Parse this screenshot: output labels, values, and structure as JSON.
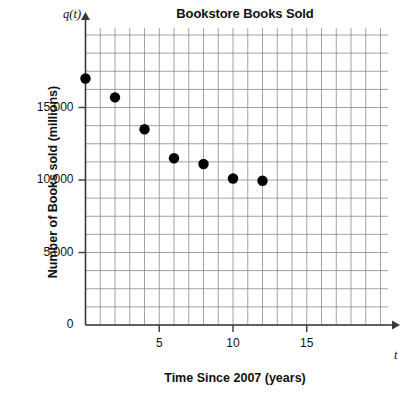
{
  "chart_data": {
    "type": "scatter",
    "title": "Bookstore Books Sold",
    "xlabel": "Time Since 2007 (years)",
    "ylabel": "Number of Books sold (millions)",
    "x_axis_symbol": "t",
    "y_axis_symbol": "q(t)",
    "x": [
      0,
      2,
      4,
      6,
      8,
      10,
      12
    ],
    "values": [
      17000,
      15700,
      13500,
      11500,
      11100,
      10100,
      9950
    ],
    "xlim": [
      0,
      20
    ],
    "ylim": [
      0,
      22500
    ],
    "xticks": [
      5,
      10,
      15
    ],
    "xtick_labels": [
      "5",
      "10",
      "15"
    ],
    "yticks": [
      0,
      5000,
      10000,
      15000
    ],
    "ytick_labels": [
      "0",
      "5,000",
      "10,000",
      "15,000"
    ],
    "grid": true,
    "grid_spacing_x": 1,
    "grid_spacing_y": 1250,
    "legend": null,
    "marker_color": "#000000",
    "grid_color": "#8a8a8a",
    "axis_color": "#3a3a3a"
  }
}
